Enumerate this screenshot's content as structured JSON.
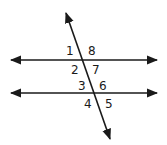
{
  "diagram": {
    "type": "parallel-lines-cut-by-transversal",
    "line_color": "#1a1a1a",
    "angles": [
      {
        "label": "1",
        "x": 68,
        "y": 55
      },
      {
        "label": "8",
        "x": 88,
        "y": 55
      },
      {
        "label": "2",
        "x": 71,
        "y": 74
      },
      {
        "label": "7",
        "x": 91,
        "y": 74
      },
      {
        "label": "3",
        "x": 78,
        "y": 91
      },
      {
        "label": "6",
        "x": 99,
        "y": 91
      },
      {
        "label": "4",
        "x": 84,
        "y": 108
      },
      {
        "label": "5",
        "x": 106,
        "y": 108
      }
    ]
  }
}
